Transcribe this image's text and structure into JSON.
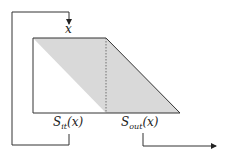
{
  "diagram": {
    "labels": {
      "input": "x",
      "s_it_main": "S",
      "s_it_sub": "it",
      "s_it_arg": "(x)",
      "s_out_main": "S",
      "s_out_sub": "out",
      "s_out_arg": "(x)"
    },
    "colors": {
      "fill": "#d9d9d9",
      "stroke": "#333333",
      "background": "#ffffff"
    }
  }
}
